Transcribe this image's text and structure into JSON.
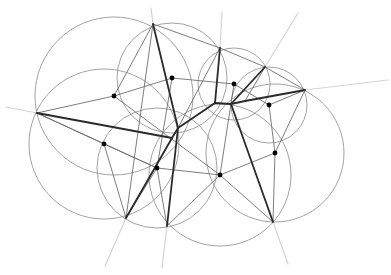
{
  "diagram": {
    "type": "delaunay-voronoi-construction",
    "width": 391,
    "height": 275,
    "colors": {
      "background": "#ffffff",
      "circle": "#8a8a8a",
      "thin_edge": "#6e6e6e",
      "thick_edge": "#2a2a2a",
      "ray": "#d4d4d4",
      "dot": "#000000"
    },
    "vertices": [
      {
        "id": "A",
        "x": 153,
        "y": 24
      },
      {
        "id": "B",
        "x": 220,
        "y": 48
      },
      {
        "id": "C",
        "x": 265,
        "y": 67
      },
      {
        "id": "D",
        "x": 305,
        "y": 90
      },
      {
        "id": "E",
        "x": 37,
        "y": 113
      },
      {
        "id": "F",
        "x": 126,
        "y": 218
      },
      {
        "id": "G",
        "x": 167,
        "y": 226
      },
      {
        "id": "H",
        "x": 273,
        "y": 222
      }
    ],
    "circumcenters": [
      {
        "x": 114,
        "y": 96
      },
      {
        "x": 172,
        "y": 78
      },
      {
        "x": 234,
        "y": 84
      },
      {
        "x": 269,
        "y": 105
      },
      {
        "x": 104,
        "y": 144
      },
      {
        "x": 157,
        "y": 168
      },
      {
        "x": 220,
        "y": 175
      },
      {
        "x": 275,
        "y": 153
      }
    ],
    "circles": [
      {
        "cx": 114,
        "cy": 96,
        "r": 79
      },
      {
        "cx": 172,
        "cy": 78,
        "r": 55
      },
      {
        "cx": 234,
        "cy": 84,
        "r": 36
      },
      {
        "cx": 269,
        "cy": 105,
        "r": 38
      },
      {
        "cx": 104,
        "cy": 144,
        "r": 75
      },
      {
        "cx": 157,
        "cy": 168,
        "r": 60
      },
      {
        "cx": 220,
        "cy": 175,
        "r": 71
      },
      {
        "cx": 275,
        "cy": 153,
        "r": 69
      }
    ],
    "thick_edges": [
      [
        153,
        24,
        178,
        128
      ],
      [
        37,
        113,
        172,
        138
      ],
      [
        172,
        138,
        178,
        128
      ],
      [
        178,
        128,
        215,
        103
      ],
      [
        215,
        103,
        231,
        104
      ],
      [
        220,
        48,
        215,
        103
      ],
      [
        231,
        104,
        265,
        67
      ],
      [
        231,
        104,
        245,
        101
      ],
      [
        245,
        101,
        305,
        90
      ],
      [
        231,
        104,
        273,
        222
      ],
      [
        172,
        138,
        126,
        218
      ],
      [
        178,
        128,
        167,
        226
      ]
    ],
    "thin_edges": [
      [
        153,
        24,
        220,
        48
      ],
      [
        153,
        24,
        114,
        96
      ],
      [
        37,
        113,
        114,
        96
      ],
      [
        114,
        96,
        172,
        78
      ],
      [
        172,
        78,
        234,
        84
      ],
      [
        234,
        84,
        269,
        105
      ],
      [
        220,
        48,
        265,
        67
      ],
      [
        265,
        67,
        305,
        90
      ],
      [
        305,
        90,
        269,
        105
      ],
      [
        269,
        105,
        275,
        153
      ],
      [
        37,
        113,
        104,
        144
      ],
      [
        104,
        144,
        157,
        168
      ],
      [
        157,
        168,
        220,
        175
      ],
      [
        220,
        175,
        275,
        153
      ],
      [
        104,
        144,
        126,
        218
      ],
      [
        157,
        168,
        167,
        226
      ],
      [
        157,
        168,
        126,
        218
      ],
      [
        220,
        175,
        273,
        222
      ],
      [
        220,
        175,
        167,
        226
      ],
      [
        275,
        153,
        273,
        222
      ],
      [
        275,
        153,
        305,
        90
      ],
      [
        153,
        24,
        126,
        218
      ],
      [
        114,
        96,
        220,
        175
      ],
      [
        172,
        78,
        157,
        168
      ],
      [
        234,
        84,
        220,
        175
      ],
      [
        220,
        48,
        178,
        128
      ],
      [
        265,
        67,
        245,
        101
      ],
      [
        37,
        113,
        157,
        168
      ]
    ],
    "rays": [
      [
        37,
        113,
        6,
        107
      ],
      [
        153,
        24,
        151,
        8
      ],
      [
        220,
        48,
        222,
        12
      ],
      [
        265,
        67,
        298,
        13
      ],
      [
        305,
        90,
        388,
        80
      ],
      [
        126,
        218,
        105,
        266
      ],
      [
        167,
        226,
        162,
        268
      ],
      [
        273,
        222,
        288,
        264
      ]
    ]
  }
}
